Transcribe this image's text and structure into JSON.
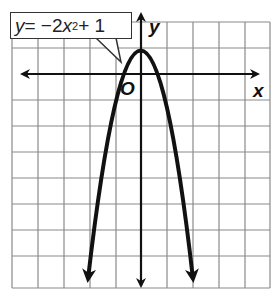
{
  "figure": {
    "equation_label": {
      "y": "y",
      "eq": " = −2",
      "x": "x",
      "exp": "2",
      "rest": " + 1"
    },
    "axis_labels": {
      "x": "x",
      "y": "y",
      "origin": "O"
    },
    "grid": {
      "cols": 10,
      "rows": 10,
      "x_range": [
        -5,
        5
      ],
      "y_range": [
        -8,
        2
      ]
    },
    "function": "y = -2x^2 + 1",
    "vertex": [
      0,
      1
    ],
    "x_intercepts": [
      -0.707,
      0.707
    ],
    "colors": {
      "grid": "#8a8a8a",
      "axes": "#111111",
      "curve": "#111111",
      "background": "#ffffff"
    }
  }
}
